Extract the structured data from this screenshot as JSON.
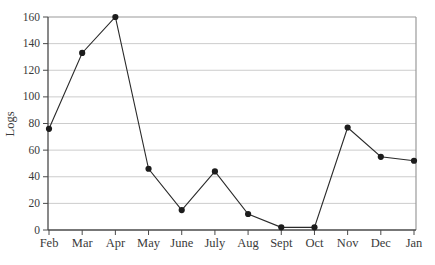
{
  "chart_data": {
    "type": "line",
    "title": "",
    "xlabel": "",
    "ylabel": "Logs",
    "categories": [
      "Feb",
      "Mar",
      "Apr",
      "May",
      "June",
      "July",
      "Aug",
      "Sept",
      "Oct",
      "Nov",
      "Dec",
      "Jan"
    ],
    "values": [
      76,
      133,
      160,
      46,
      15,
      44,
      12,
      2,
      2,
      77,
      55,
      52
    ],
    "ylim": [
      0,
      160
    ],
    "yticks": [
      0,
      20,
      40,
      60,
      80,
      100,
      120,
      140,
      160
    ],
    "grid": true,
    "legend": false,
    "marker": "filled-circle",
    "colors": {
      "line": "#2a2a2a",
      "marker": "#1c1c1c",
      "grid": "#cccccc",
      "plot_border": "#9a9a9a",
      "axis": "#4a4a4a",
      "text": "#3a3a3a",
      "background": "#ffffff"
    }
  }
}
